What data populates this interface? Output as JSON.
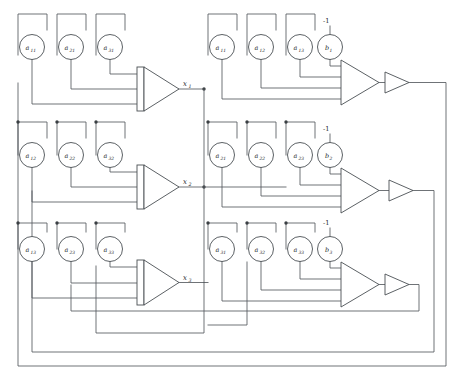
{
  "diagram": {
    "type": "schematic",
    "colors": {
      "wire": "#555a5e",
      "outline": "#4a4f53",
      "text": "#24282b",
      "background": "#ffffff",
      "junction": "#3a3f43"
    }
  },
  "rows": [
    {
      "id": "row-1",
      "output_label": "x",
      "output_sub": "1",
      "left_coefficients": [
        {
          "base": "a",
          "sub": "11"
        },
        {
          "base": "a",
          "sub": "21"
        },
        {
          "base": "a",
          "sub": "31"
        }
      ],
      "right_coefficients": [
        {
          "base": "a",
          "sub": "11"
        },
        {
          "base": "a",
          "sub": "12"
        },
        {
          "base": "a",
          "sub": "13"
        }
      ],
      "constant": {
        "base": "b",
        "sub": "1"
      },
      "constant_source": "-1"
    },
    {
      "id": "row-2",
      "output_label": "x",
      "output_sub": "2",
      "left_coefficients": [
        {
          "base": "a",
          "sub": "12"
        },
        {
          "base": "a",
          "sub": "22"
        },
        {
          "base": "a",
          "sub": "32"
        }
      ],
      "right_coefficients": [
        {
          "base": "a",
          "sub": "21"
        },
        {
          "base": "a",
          "sub": "22"
        },
        {
          "base": "a",
          "sub": "23"
        }
      ],
      "constant": {
        "base": "b",
        "sub": "2"
      },
      "constant_source": "-1"
    },
    {
      "id": "row-3",
      "output_label": "x",
      "output_sub": "3",
      "left_coefficients": [
        {
          "base": "a",
          "sub": "13"
        },
        {
          "base": "a",
          "sub": "23"
        },
        {
          "base": "a",
          "sub": "33"
        }
      ],
      "right_coefficients": [
        {
          "base": "a",
          "sub": "31"
        },
        {
          "base": "a",
          "sub": "32"
        },
        {
          "base": "a",
          "sub": "33"
        }
      ],
      "constant": {
        "base": "b",
        "sub": "3"
      },
      "constant_source": "-1"
    }
  ],
  "components": {
    "summing_amplifier_count": 6,
    "inverter_count": 3,
    "potentiometer_count": 21
  }
}
